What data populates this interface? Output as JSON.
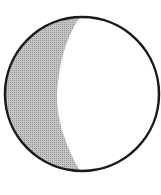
{
  "diagram": {
    "phase": "waxing gibbous",
    "colors": {
      "background": "#ffffff",
      "outline": "#1a1a1a",
      "shadow": "#b8b8b8",
      "lit": "#ffffff"
    }
  }
}
